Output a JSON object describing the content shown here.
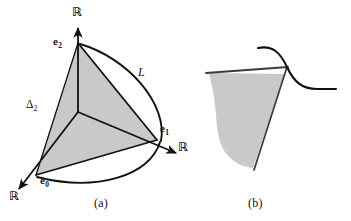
{
  "figure": {
    "background_color": "#ffffff",
    "line_color": "#111111",
    "fill_color": "#c9c9c9",
    "panels": [
      {
        "id": "panel-a",
        "caption": "(a)",
        "description": "2-simplex with axes and curve L"
      },
      {
        "id": "panel-b",
        "caption": "(b)",
        "description": "shaded funnel region crossed by an S-shaped curve"
      }
    ]
  },
  "panel_a": {
    "caption": "(a)",
    "vertices": [
      {
        "name": "e0",
        "label_base": "e",
        "label_sub": "0"
      },
      {
        "name": "e1",
        "label_base": "e",
        "label_sub": "1"
      },
      {
        "name": "e2",
        "label_base": "e",
        "label_sub": "2"
      }
    ],
    "axis_labels": [
      {
        "name": "axis-top",
        "text": "ℝ"
      },
      {
        "name": "axis-right",
        "text": "ℝ"
      },
      {
        "name": "axis-lower-left",
        "text": "ℝ"
      }
    ],
    "simplex_label": {
      "base": "Δ",
      "sub": "2"
    },
    "curve_label": "L"
  },
  "panel_b": {
    "caption": "(b)",
    "region_name": "shaded-funnel-region",
    "curve_name": "s-curve"
  }
}
